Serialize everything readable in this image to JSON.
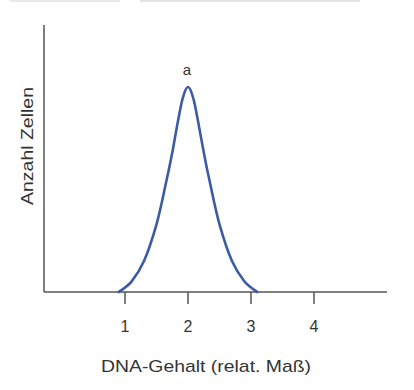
{
  "chart_data": {
    "type": "line",
    "title": "",
    "xlabel": "DNA-Gehalt (relat. Maß)",
    "ylabel": "Anzahl Zellen",
    "x_ticks": [
      "1",
      "2",
      "3",
      "4"
    ],
    "xlim": [
      0,
      4.9
    ],
    "ylim": [
      0,
      1.15
    ],
    "grid": false,
    "legend": null,
    "annotations": [
      {
        "text": "a",
        "x": 2.0,
        "y": 1.08
      }
    ],
    "series": [
      {
        "name": "a",
        "color": "#3d5aa6",
        "x": [
          0.9,
          1.1,
          1.3,
          1.5,
          1.65,
          1.75,
          1.85,
          1.92,
          2.0,
          2.08,
          2.15,
          2.25,
          2.35,
          2.5,
          2.7,
          2.9,
          3.1
        ],
        "y": [
          0.0,
          0.05,
          0.15,
          0.33,
          0.53,
          0.68,
          0.85,
          0.95,
          1.0,
          0.95,
          0.85,
          0.68,
          0.53,
          0.33,
          0.15,
          0.05,
          0.0
        ]
      }
    ]
  },
  "labels": {
    "peak": "a",
    "xaxis": "DNA-Gehalt (relat. Maß)",
    "yaxis": "Anzahl Zellen",
    "ticks": [
      "1",
      "2",
      "3",
      "4"
    ]
  }
}
